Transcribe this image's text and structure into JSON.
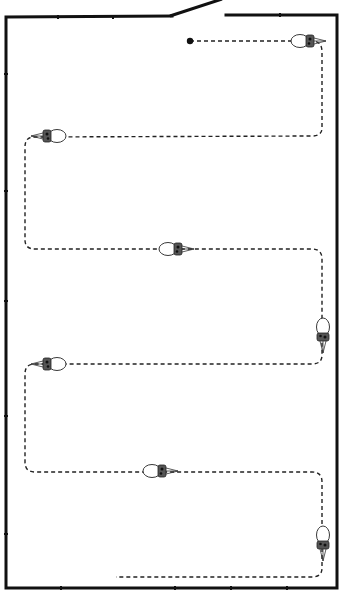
{
  "diagram": {
    "title": "",
    "colors": {
      "wall": "#111111",
      "path": "#222222",
      "background": "#ffffff"
    },
    "elements": {
      "room": "room-walls",
      "door": "door-leaf",
      "start": "start-point",
      "path": "coverage-path",
      "vehicles": [
        {
          "id": "vehicle-1",
          "heading": "right"
        },
        {
          "id": "vehicle-2",
          "heading": "left"
        },
        {
          "id": "vehicle-3",
          "heading": "right"
        },
        {
          "id": "vehicle-4",
          "heading": "down"
        },
        {
          "id": "vehicle-5",
          "heading": "left"
        },
        {
          "id": "vehicle-6",
          "heading": "right"
        },
        {
          "id": "vehicle-7",
          "heading": "down"
        }
      ],
      "path_passes": 6
    }
  }
}
